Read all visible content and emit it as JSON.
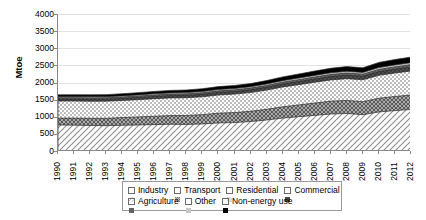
{
  "chart_data": {
    "type": "area",
    "stacked": true,
    "title": "",
    "subtitle": "",
    "xlabel": "",
    "ylabel": "Mtoe",
    "ylim": [
      0,
      4000
    ],
    "ytick_step": 500,
    "yticks": [
      "0",
      "500",
      "1000",
      "1500",
      "2000",
      "2500",
      "3000",
      "3500",
      "4000"
    ],
    "grid": true,
    "legend_position": "bottom",
    "x": [
      1990,
      1991,
      1992,
      1993,
      1994,
      1995,
      1996,
      1997,
      1998,
      1999,
      2000,
      2001,
      2002,
      2003,
      2004,
      2005,
      2006,
      2007,
      2008,
      2009,
      2010,
      2011,
      2012
    ],
    "categories": [
      "1990",
      "1991",
      "1992",
      "1993",
      "1994",
      "1995",
      "1996",
      "1997",
      "1998",
      "1999",
      "2000",
      "2001",
      "2002",
      "2003",
      "2004",
      "2005",
      "2006",
      "2007",
      "2008",
      "2009",
      "2010",
      "2011",
      "2012"
    ],
    "series": [
      {
        "name": "Industry",
        "pattern": "diagonal-hatch-light",
        "color": "#d9d9d9",
        "values": [
          760,
          755,
          745,
          740,
          750,
          760,
          770,
          780,
          775,
          790,
          820,
          830,
          860,
          905,
          960,
          1000,
          1040,
          1080,
          1095,
          1060,
          1140,
          1180,
          1210
        ]
      },
      {
        "name": "Transport",
        "pattern": "cross-hatch-dense",
        "color": "#9e9e9e",
        "values": [
          200,
          205,
          210,
          215,
          225,
          235,
          245,
          255,
          262,
          272,
          285,
          292,
          300,
          312,
          330,
          345,
          360,
          375,
          382,
          380,
          400,
          412,
          425
        ]
      },
      {
        "name": "Residential",
        "pattern": "checker-light",
        "color": "#e0e0e0",
        "values": [
          500,
          500,
          498,
          500,
          500,
          505,
          512,
          515,
          518,
          522,
          530,
          540,
          548,
          562,
          580,
          592,
          608,
          620,
          635,
          640,
          670,
          685,
          700
        ]
      },
      {
        "name": "Commercial",
        "pattern": "solid-dark",
        "color": "#4a4a4a",
        "values": [
          55,
          56,
          57,
          58,
          60,
          62,
          64,
          66,
          68,
          70,
          73,
          75,
          78,
          82,
          86,
          90,
          94,
          98,
          101,
          102,
          108,
          112,
          116
        ]
      },
      {
        "name": "Agriculture",
        "pattern": "solid-mid-dark",
        "color": "#6e6e6e",
        "values": [
          40,
          40,
          41,
          41,
          42,
          43,
          44,
          45,
          46,
          47,
          48,
          49,
          50,
          52,
          54,
          56,
          58,
          60,
          62,
          62,
          65,
          67,
          69
        ]
      },
      {
        "name": "Other",
        "pattern": "solid-light-gray",
        "color": "#c9c9c9",
        "values": [
          30,
          30,
          31,
          31,
          32,
          33,
          34,
          35,
          36,
          37,
          38,
          39,
          40,
          42,
          44,
          46,
          48,
          50,
          51,
          51,
          54,
          56,
          58
        ]
      },
      {
        "name": "Non-energy use",
        "pattern": "solid-black",
        "color": "#000000",
        "values": [
          55,
          56,
          58,
          60,
          63,
          66,
          70,
          73,
          76,
          80,
          86,
          88,
          92,
          100,
          110,
          118,
          126,
          134,
          138,
          134,
          150,
          158,
          165
        ]
      }
    ],
    "totals": [
      1640,
      1642,
      1640,
      1645,
      1672,
      1704,
      1739,
      1769,
      1781,
      1818,
      1880,
      1913,
      1968,
      2055,
      2164,
      2247,
      2334,
      2417,
      2464,
      2429,
      2587,
      2670,
      2743
    ]
  },
  "legend": {
    "rows": [
      [
        {
          "label": "Industry",
          "swatch": "industry-swatch"
        },
        {
          "label": "Transport",
          "swatch": "transport-swatch"
        },
        {
          "label": "Residential",
          "swatch": "residential-swatch"
        },
        {
          "label": "Commercial",
          "swatch": "commercial-swatch"
        }
      ],
      [
        {
          "label": "Agriculture",
          "swatch": "agriculture-swatch"
        },
        {
          "label": "Other",
          "swatch": "other-swatch"
        },
        {
          "label": "Non-energy use",
          "swatch": "nonenergy-swatch"
        }
      ]
    ]
  }
}
